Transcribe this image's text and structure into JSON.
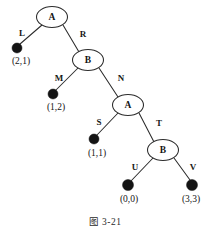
{
  "figure": {
    "caption": "图 3-21",
    "background_color": "#ffffff",
    "ink_color": "#141414",
    "leaf_color": "#141414"
  },
  "tree": {
    "internal_nodes": [
      {
        "id": "n0",
        "label": "A",
        "x": 52,
        "y": 17,
        "rx": 15.5,
        "ry": 10.5
      },
      {
        "id": "n1",
        "label": "B",
        "x": 88,
        "y": 60,
        "rx": 15.5,
        "ry": 10.5
      },
      {
        "id": "n2",
        "label": "A",
        "x": 128,
        "y": 105,
        "rx": 15.5,
        "ry": 10.5
      },
      {
        "id": "n3",
        "label": "B",
        "x": 163,
        "y": 150,
        "rx": 15.5,
        "ry": 10.5
      }
    ],
    "leaves": [
      {
        "id": "l0",
        "x": 17,
        "y": 48,
        "r": 5.0,
        "coord": "(2,1)",
        "coord_x": 21,
        "coord_y": 62
      },
      {
        "id": "l1",
        "x": 53,
        "y": 94,
        "r": 5.0,
        "coord": "(1,2)",
        "coord_x": 56,
        "coord_y": 108
      },
      {
        "id": "l2",
        "x": 94,
        "y": 139,
        "r": 5.0,
        "coord": "(1,1)",
        "coord_x": 97,
        "coord_y": 154
      },
      {
        "id": "l3",
        "x": 128,
        "y": 185,
        "r": 5.5,
        "coord": "(0,0)",
        "coord_x": 129,
        "coord_y": 200
      },
      {
        "id": "l4",
        "x": 192,
        "y": 185,
        "r": 5.5,
        "coord": "(3,3)",
        "coord_x": 191,
        "coord_y": 200
      }
    ],
    "edges": [
      {
        "id": "e-L",
        "label": "L",
        "from": "n0",
        "to": "l0",
        "x1": 42,
        "y1": 25,
        "x2": 20,
        "y2": 44,
        "label_x": 22,
        "label_y": 33
      },
      {
        "id": "e-R",
        "label": "R",
        "from": "n0",
        "to": "n1",
        "x1": 63,
        "y1": 25,
        "x2": 79,
        "y2": 52,
        "label_x": 83,
        "label_y": 34
      },
      {
        "id": "e-M",
        "label": "M",
        "from": "n1",
        "to": "l1",
        "x1": 78,
        "y1": 68,
        "x2": 56,
        "y2": 90,
        "label_x": 59,
        "label_y": 78
      },
      {
        "id": "e-N",
        "label": "N",
        "from": "n1",
        "to": "n2",
        "x1": 99,
        "y1": 68,
        "x2": 118,
        "y2": 97,
        "label_x": 121,
        "label_y": 78
      },
      {
        "id": "e-S",
        "label": "S",
        "from": "n2",
        "to": "l2",
        "x1": 118,
        "y1": 113,
        "x2": 97,
        "y2": 135,
        "label_x": 99,
        "label_y": 122
      },
      {
        "id": "e-T",
        "label": "T",
        "from": "n2",
        "to": "n3",
        "x1": 139,
        "y1": 113,
        "x2": 154,
        "y2": 142,
        "label_x": 159,
        "label_y": 123
      },
      {
        "id": "e-U",
        "label": "U",
        "from": "n3",
        "to": "l3",
        "x1": 153,
        "y1": 158,
        "x2": 131,
        "y2": 181,
        "label_x": 135,
        "label_y": 167
      },
      {
        "id": "e-V",
        "label": "V",
        "from": "n3",
        "to": "l4",
        "x1": 174,
        "y1": 158,
        "x2": 190,
        "y2": 180,
        "label_x": 193,
        "label_y": 167
      }
    ]
  }
}
